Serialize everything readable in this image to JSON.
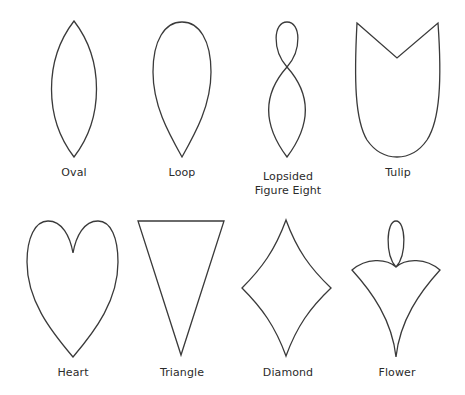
{
  "figure": {
    "stroke_color": "#3a3a3a",
    "background_color": "#ffffff",
    "shapes": [
      {
        "id": "oval",
        "label": "Oval"
      },
      {
        "id": "loop",
        "label": "Loop"
      },
      {
        "id": "lopsided-figure-eight",
        "label_line1": "Lopsided",
        "label_line2": "Figure Eight"
      },
      {
        "id": "tulip",
        "label": "Tulip"
      },
      {
        "id": "heart",
        "label": "Heart"
      },
      {
        "id": "triangle",
        "label": "Triangle"
      },
      {
        "id": "diamond",
        "label": "Diamond"
      },
      {
        "id": "flower",
        "label": "Flower"
      }
    ]
  }
}
